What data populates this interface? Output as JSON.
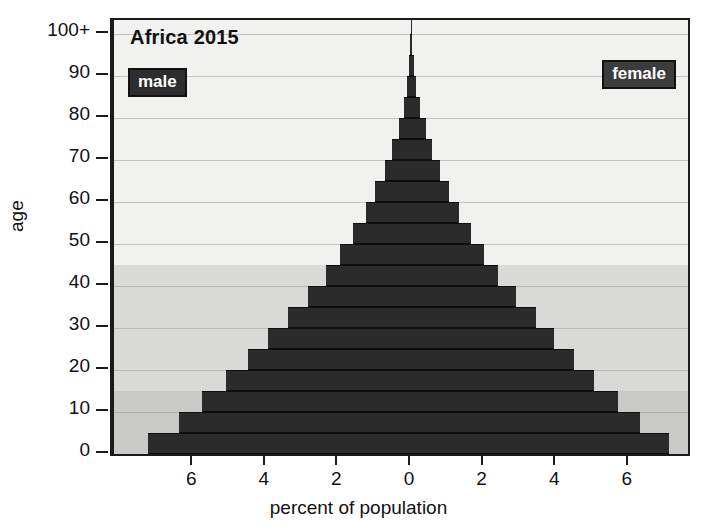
{
  "chart_data": {
    "type": "bar",
    "subtype": "population-pyramid",
    "title": "Africa 2015",
    "xlabel": "percent of population",
    "ylabel": "age",
    "xlim": [
      -7.6,
      7.6
    ],
    "ylim": [
      0,
      100
    ],
    "grid": true,
    "legend_position": "inside-top-left and inside-top-right",
    "xtick_labels": [
      "6",
      "4",
      "2",
      "0",
      "2",
      "4",
      "6"
    ],
    "xtick_values": [
      -6,
      -4,
      -2,
      0,
      2,
      4,
      6
    ],
    "ytick_labels": [
      "0",
      "10",
      "20",
      "30",
      "40",
      "50",
      "60",
      "70",
      "80",
      "90",
      "100+"
    ],
    "ytick_values": [
      0,
      10,
      20,
      30,
      40,
      50,
      60,
      70,
      80,
      90,
      100
    ],
    "categories": [
      "0-4",
      "5-9",
      "10-14",
      "15-19",
      "20-24",
      "25-29",
      "30-34",
      "35-39",
      "40-44",
      "45-49",
      "50-54",
      "55-59",
      "60-64",
      "65-69",
      "70-74",
      "75-79",
      "80-84",
      "85-89",
      "90-94",
      "95-99",
      "100+"
    ],
    "series": [
      {
        "name": "male",
        "color": "#2b2b2b",
        "side": "left",
        "values": [
          7.25,
          6.4,
          5.75,
          5.1,
          4.5,
          3.95,
          3.4,
          2.85,
          2.35,
          1.95,
          1.6,
          1.25,
          0.98,
          0.72,
          0.52,
          0.34,
          0.2,
          0.11,
          0.05,
          0.02,
          0.01
        ]
      },
      {
        "name": "female",
        "color": "#2b2b2b",
        "side": "right",
        "values": [
          7.1,
          6.3,
          5.7,
          5.05,
          4.5,
          3.95,
          3.45,
          2.9,
          2.4,
          2.0,
          1.65,
          1.32,
          1.05,
          0.8,
          0.58,
          0.4,
          0.25,
          0.14,
          0.07,
          0.03,
          0.01
        ]
      }
    ],
    "background_bands": [
      {
        "name": "youth",
        "age_from": 0,
        "age_to": 15,
        "color": "#c9c9c7"
      },
      {
        "name": "working-age",
        "age_from": 15,
        "age_to": 45,
        "color": "#d9d9d7"
      },
      {
        "name": "older",
        "age_from": 45,
        "age_to": 100,
        "color": "#f1f1ef"
      }
    ]
  },
  "legend": {
    "male_label": "male",
    "female_label": "female"
  }
}
